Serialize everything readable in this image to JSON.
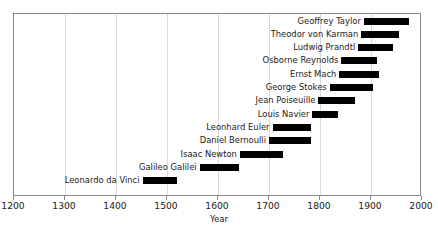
{
  "chart_data": {
    "type": "bar",
    "orientation": "horizontal",
    "subtype": "timeline-gantt",
    "title": "",
    "xlabel": "Year",
    "ylabel": "",
    "xlim": [
      1200,
      2000
    ],
    "xticks": [
      1200,
      1300,
      1400,
      1500,
      1600,
      1700,
      1800,
      1900,
      2000
    ],
    "xticklabels": [
      "1200",
      "1300",
      "1400",
      "1500",
      "1600",
      "1700",
      "1800",
      "1900",
      "2000"
    ],
    "grid": "vertical",
    "legend": "none",
    "bar_color": "#000000",
    "frame_color": "#8a8a8a",
    "grid_color": "#d9d9d9",
    "categories": [
      "Geoffrey Taylor",
      "Theodor von Karman",
      "Ludwig Prandtl",
      "Osborne Reynolds",
      "Ernst Mach",
      "George Stokes",
      "Jean Poiseuille",
      "Louis Navier",
      "Leonhard Euler",
      "Daniel Bernoulli",
      "Isaac Newton",
      "Galileo Galilei",
      "Leonardo da Vinci"
    ],
    "bars": [
      {
        "label": "Geoffrey Taylor",
        "start": 1886,
        "end": 1975
      },
      {
        "label": "Theodor von Karman",
        "start": 1881,
        "end": 1955
      },
      {
        "label": "Ludwig Prandtl",
        "start": 1875,
        "end": 1943
      },
      {
        "label": "Osborne Reynolds",
        "start": 1842,
        "end": 1912
      },
      {
        "label": "Ernst Mach",
        "start": 1838,
        "end": 1916
      },
      {
        "label": "George Stokes",
        "start": 1819,
        "end": 1903
      },
      {
        "label": "Jean Poiseuille",
        "start": 1797,
        "end": 1869
      },
      {
        "label": "Louis Navier",
        "start": 1785,
        "end": 1836
      },
      {
        "label": "Leonhard Euler",
        "start": 1707,
        "end": 1783
      },
      {
        "label": "Daniel Bernoulli",
        "start": 1700,
        "end": 1782
      },
      {
        "label": "Isaac Newton",
        "start": 1643,
        "end": 1727
      },
      {
        "label": "Galileo Galilei",
        "start": 1564,
        "end": 1642
      },
      {
        "label": "Leonardo da Vinci",
        "start": 1452,
        "end": 1519
      }
    ]
  }
}
